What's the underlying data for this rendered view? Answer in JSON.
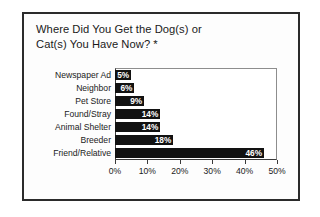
{
  "figure": {
    "title_lines": [
      "Where Did You Get the Dog(s) or",
      "Cat(s) You Have Now? *"
    ],
    "border_color": "#2b2b2b",
    "bar_color": "#121212",
    "value_label_color": "#ffffff"
  },
  "chart_data": {
    "type": "bar",
    "orientation": "horizontal",
    "xlabel": "",
    "ylabel": "",
    "categories": [
      "Newspaper Ad",
      "Neighbor",
      "Pet Store",
      "Found/Stray",
      "Animal Shelter",
      "Breeder",
      "Friend/Relative"
    ],
    "values": [
      5,
      6,
      9,
      14,
      14,
      18,
      46
    ],
    "value_labels": [
      "5%",
      "6%",
      "9%",
      "14%",
      "14%",
      "18%",
      "46%"
    ],
    "xlim": [
      0,
      50
    ],
    "xticks": [
      0,
      10,
      20,
      30,
      40,
      50
    ],
    "xtick_labels": [
      "0%",
      "10%",
      "20%",
      "30%",
      "40%",
      "50%"
    ],
    "grid": false,
    "legend": false
  }
}
